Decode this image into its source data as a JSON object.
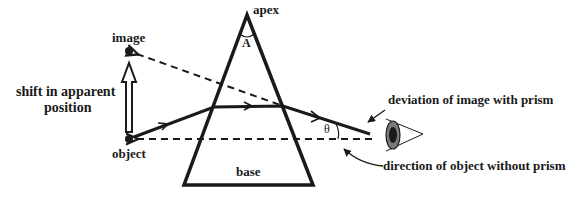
{
  "diagram": {
    "labels": {
      "apex": "apex",
      "angle_apex": "A",
      "base": "base",
      "image": "image",
      "object": "object",
      "shift": "shift in apparent",
      "shift2": "position",
      "theta": "θ",
      "deviation": "deviation of image with prism",
      "direction": "direction of object without prism"
    },
    "colors": {
      "stroke": "#1a1a1a",
      "background": "#ffffff",
      "eye_iris": "#555555"
    }
  }
}
